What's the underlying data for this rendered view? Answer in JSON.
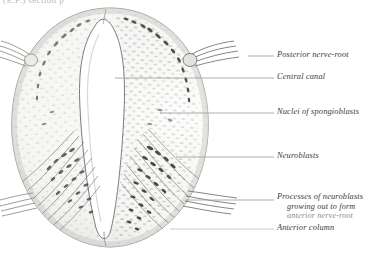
{
  "plate": {
    "caption_remnant": "(E.F.)   section   p",
    "figure_title": "Transverse section of developing spinal cord",
    "background_color": "#ffffff",
    "ink_color": "#3a3a38",
    "tissue_gray": "#9a9a96",
    "nuclei_gray": "#6f6f6c",
    "outline_gray": "#8b8b88",
    "canal_fill": "#ffffff"
  },
  "labels": [
    {
      "id": "posterior-nerve-root",
      "text": "Posterior nerve-root",
      "x": 277,
      "y": 57,
      "leader_x": 248,
      "leader_w": 26,
      "leader_y": 56
    },
    {
      "id": "central-canal",
      "text": "Central canal",
      "x": 277,
      "y": 80,
      "leader_x": 148,
      "leader_w": 126,
      "leader_y": 78
    },
    {
      "id": "nuclei-of-spongioblasts",
      "text": "Nuclei of spongioblasts",
      "x": 277,
      "y": 115,
      "leader_x": 196,
      "leader_w": 78,
      "leader_y": 113
    },
    {
      "id": "neuroblasts",
      "text": "Neuroblasts",
      "x": 277,
      "y": 159,
      "leader_x": 212,
      "leader_w": 62,
      "leader_y": 157
    },
    {
      "id": "processes-line-1",
      "text": "Processes of neuroblasts",
      "x": 277,
      "y": 199,
      "leader_x": 208,
      "leader_w": 66,
      "leader_y": 200
    },
    {
      "id": "processes-line-2",
      "text": "growing out to form",
      "x": 287,
      "y": 209
    },
    {
      "id": "processes-line-3",
      "text": "anterior nerve-root",
      "x": 287,
      "y": 218
    },
    {
      "id": "anterior-column",
      "text": "Anterior column",
      "x": 277,
      "y": 231,
      "leader_x": 196,
      "leader_w": 78,
      "leader_y": 229
    }
  ],
  "anatomy": {
    "specimen_outline": "oval transverse section",
    "central_canal_shape": "keyhole / elongated slit, widened dorsally",
    "posterior_aspect": "top",
    "anterior_aspect": "bottom",
    "features": [
      "posterior nerve-root bundles entering dorso-laterally (both sides)",
      "stippled spongioblast nuclei filling mantle layer",
      "neuroblast cell bodies with dark nuclei in lateral mantle",
      "fan of neuroblast processes radiating ventro-laterally",
      "anterior nerve-root fibres emerging ventro-laterally",
      "anterior column at ventral margin"
    ]
  }
}
